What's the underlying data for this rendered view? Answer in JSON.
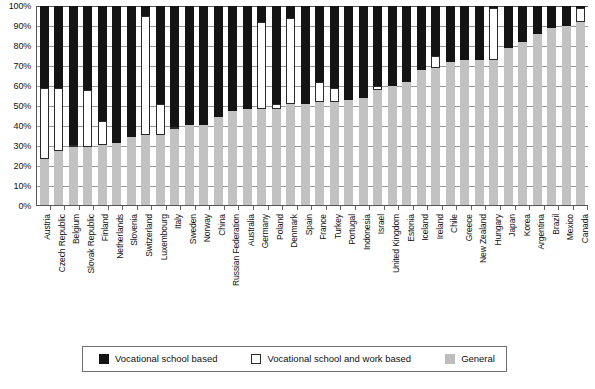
{
  "chart_data": {
    "type": "bar",
    "stacked": true,
    "orientation": "vertical",
    "title": "",
    "subtitle": "",
    "xlabel": "",
    "ylabel": "",
    "ylim": [
      0,
      100
    ],
    "ytick_labels": [
      "0%",
      "10%",
      "20%",
      "30%",
      "40%",
      "50%",
      "60%",
      "70%",
      "80%",
      "90%",
      "100%"
    ],
    "ytick_values": [
      0,
      10,
      20,
      30,
      40,
      50,
      60,
      70,
      80,
      90,
      100
    ],
    "grid": true,
    "grid_axis": "y",
    "legend_position": "bottom",
    "categories": [
      "Austria",
      "Czech Republic",
      "Belgium",
      "Slovak Republic",
      "Finland",
      "Netherlands",
      "Slovenia",
      "Switzerland",
      "Luxembourg",
      "Italy",
      "Sweden",
      "Norway",
      "China",
      "Russian Federation",
      "Australia",
      "Germany",
      "Poland",
      "Denmark",
      "Spain",
      "France",
      "Turkey",
      "Portugal",
      "Indonesia",
      "Israel",
      "United Kingdom",
      "Estonia",
      "Iceland",
      "Ireland",
      "Chile",
      "Greece",
      "New Zealand",
      "Hungary",
      "Japan",
      "Korea",
      "Argentina",
      "Brazil",
      "Mexico",
      "Canada"
    ],
    "series": [
      {
        "name": "General",
        "color": "#c2c2c2",
        "values": [
          23,
          27,
          29,
          29,
          30,
          31,
          34,
          35,
          35,
          38,
          40,
          40,
          44,
          47,
          48,
          48,
          48,
          51,
          51,
          52,
          52,
          53,
          54,
          58,
          60,
          62,
          68,
          69,
          72,
          73,
          73,
          73,
          79,
          82,
          86,
          89,
          90,
          92
        ]
      },
      {
        "name": "Vocational school and work based",
        "color": "#ffffff",
        "values": [
          36,
          32,
          1,
          29,
          12,
          0,
          0,
          60,
          16,
          1,
          0,
          0,
          0,
          0,
          0,
          44,
          3,
          43,
          0,
          10,
          7,
          0,
          0,
          2,
          0,
          0,
          0,
          6,
          0,
          0,
          0,
          26,
          0,
          0,
          0,
          0,
          0,
          7
        ]
      },
      {
        "name": "Vocational school based",
        "color": "#141414",
        "values": [
          41,
          41,
          70,
          42,
          58,
          69,
          66,
          5,
          49,
          61,
          60,
          60,
          56,
          53,
          52,
          8,
          49,
          6,
          49,
          38,
          41,
          47,
          46,
          40,
          40,
          38,
          32,
          25,
          28,
          27,
          27,
          1,
          21,
          18,
          14,
          11,
          10,
          1
        ]
      }
    ],
    "legend": [
      {
        "label": "Vocational school based",
        "swatch": "black"
      },
      {
        "label": "Vocational school and work based",
        "swatch": "white"
      },
      {
        "label": "General",
        "swatch": "gray"
      }
    ]
  }
}
